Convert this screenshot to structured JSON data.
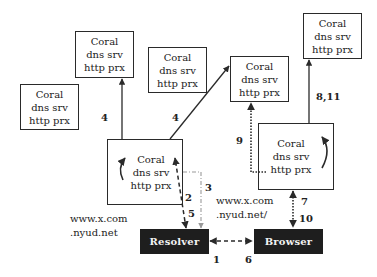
{
  "diagram": {
    "nodes": [
      {
        "id": "coral-top-left",
        "lines": [
          "Coral",
          "dns srv",
          "http prx"
        ]
      },
      {
        "id": "coral-left",
        "lines": [
          "Coral",
          "dns srv",
          "http prx"
        ]
      },
      {
        "id": "coral-middle",
        "lines": [
          "Coral",
          "dns srv",
          "http prx"
        ]
      },
      {
        "id": "coral-center-right",
        "lines": [
          "Coral",
          "dns srv",
          "http prx"
        ]
      },
      {
        "id": "coral-top-right",
        "lines": [
          "Coral",
          "dns srv",
          "http prx"
        ]
      },
      {
        "id": "coral-lower-left",
        "lines": [
          "Coral",
          "dns srv",
          "http prx"
        ]
      },
      {
        "id": "coral-lower-right",
        "lines": [
          "Coral",
          "dns srv",
          "http prx"
        ]
      }
    ],
    "resolver": {
      "label": "Resolver"
    },
    "browser": {
      "label": "Browser"
    },
    "edge_labels": {
      "e4_left": "4",
      "e4_mid": "4",
      "e2": "2",
      "e5": "5",
      "e3": "3",
      "e9": "9",
      "e8_11": "8,11",
      "e7": "7",
      "e10": "10",
      "e1": "1",
      "e6": "6"
    },
    "urls": {
      "left": [
        "www.x.com",
        ".nyud.net"
      ],
      "right": [
        "www.x.com",
        ".nyud.net/"
      ]
    },
    "colors": {
      "line": "#2a2a2a",
      "dashdot": "#9a9a9a",
      "dark_box": "#1e1e1e",
      "dark_text": "#f2f2f2"
    }
  }
}
